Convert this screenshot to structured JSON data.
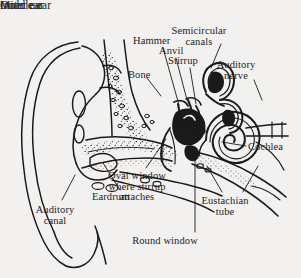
{
  "figure": {
    "style": "black-and-white line drawing, cross-section",
    "background_color": "#f2f1ef",
    "ink_color": "#1a1a1a"
  },
  "sections": [
    {
      "id": "outer",
      "label": "Outer ear",
      "x": 50,
      "y": 10
    },
    {
      "id": "middle",
      "label": "Middle ear",
      "x": 124,
      "y": 10
    },
    {
      "id": "inner",
      "label": "Inner ear",
      "x": 203,
      "y": 10
    }
  ],
  "parts": [
    {
      "id": "semicircular-canals",
      "label": "Semicircular\ncanals",
      "x": 199,
      "y": 26,
      "align": "center"
    },
    {
      "id": "hammer",
      "label": "Hammer",
      "x": 133,
      "y": 36,
      "align": "left"
    },
    {
      "id": "anvil",
      "label": "Anvil",
      "x": 159,
      "y": 46,
      "align": "left"
    },
    {
      "id": "stirrup",
      "label": "Stirrup",
      "x": 168,
      "y": 56,
      "align": "left"
    },
    {
      "id": "auditory-nerve",
      "label": "Auditory\nnerve",
      "x": 236,
      "y": 60,
      "align": "center"
    },
    {
      "id": "bone",
      "label": "Bone",
      "x": 128,
      "y": 70,
      "align": "left"
    },
    {
      "id": "cochlea",
      "label": "Cochlea",
      "x": 248,
      "y": 142,
      "align": "left"
    },
    {
      "id": "oval-window",
      "label": "Oval window\nwhere stirrup\nattaches",
      "x": 137,
      "y": 171,
      "align": "center"
    },
    {
      "id": "eardrum",
      "label": "Eardrum",
      "x": 92,
      "y": 192,
      "align": "left"
    },
    {
      "id": "eustachian-tube",
      "label": "Eustachian\ntube",
      "x": 225,
      "y": 196,
      "align": "center"
    },
    {
      "id": "auditory-canal",
      "label": "Auditory\ncanal",
      "x": 55,
      "y": 205,
      "align": "center"
    },
    {
      "id": "round-window",
      "label": "Round window",
      "x": 165,
      "y": 236,
      "align": "center"
    }
  ],
  "leader_lines": [
    {
      "id": "leader-hammer",
      "from": [
        163,
        48
      ],
      "to": [
        179,
        105
      ]
    },
    {
      "id": "leader-anvil",
      "from": [
        176,
        58
      ],
      "to": [
        187,
        100
      ]
    },
    {
      "id": "leader-stirrup",
      "from": [
        190,
        68
      ],
      "to": [
        196,
        104
      ]
    },
    {
      "id": "leader-bone",
      "from": [
        147,
        78
      ],
      "to": [
        161,
        96
      ]
    },
    {
      "id": "leader-semicircular",
      "from": [
        221,
        44
      ],
      "to": [
        211,
        68
      ]
    },
    {
      "id": "leader-auditory-nerve",
      "from": [
        254,
        80
      ],
      "to": [
        262,
        100
      ]
    },
    {
      "id": "leader-cochlea",
      "from": [
        246,
        146
      ],
      "to": [
        222,
        142
      ]
    },
    {
      "id": "leader-eardrum",
      "from": [
        120,
        190
      ],
      "to": [
        103,
        163
      ]
    },
    {
      "id": "leader-oval-window",
      "from": [
        146,
        168
      ],
      "to": [
        166,
        139
      ]
    },
    {
      "id": "leader-round-window",
      "from": [
        195,
        232
      ],
      "to": [
        195,
        150
      ]
    },
    {
      "id": "leader-eustachian-a",
      "from": [
        222,
        192
      ],
      "to": [
        207,
        166
      ]
    },
    {
      "id": "leader-eustachian-b",
      "from": [
        243,
        192
      ],
      "to": [
        258,
        166
      ]
    },
    {
      "id": "leader-auditory-canal",
      "from": [
        62,
        200
      ],
      "to": [
        75,
        175
      ]
    }
  ]
}
